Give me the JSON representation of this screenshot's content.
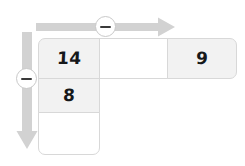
{
  "diagram": {
    "type": "bar-model",
    "top_bar": {
      "segments": [
        {
          "name": "known-part-left",
          "value": "14",
          "shaded": true
        },
        {
          "name": "unknown-middle",
          "value": "",
          "shaded": false
        },
        {
          "name": "known-part-right",
          "value": "9",
          "shaded": true
        }
      ]
    },
    "left_column": {
      "segments": [
        {
          "name": "shared-top-cell",
          "value": "14",
          "shaded": true
        },
        {
          "name": "known-cell",
          "value": "8",
          "shaded": true
        },
        {
          "name": "unknown-cell",
          "value": "",
          "shaded": false
        }
      ]
    },
    "annotations": {
      "horizontal_arrow": {
        "icon": "arrow-right-icon",
        "operator_icon": "minus-circle-icon",
        "operator": "−",
        "direction": "right"
      },
      "vertical_arrow": {
        "icon": "arrow-down-icon",
        "operator_icon": "minus-circle-icon",
        "operator": "−",
        "direction": "down"
      }
    },
    "colors": {
      "shaded_cell": "#f2f2f2",
      "empty_cell": "#ffffff",
      "cell_border": "#d8d8d8",
      "arrow": "#d0d0d0",
      "badge_border": "#c9c9c9",
      "text": "#16181a"
    }
  }
}
